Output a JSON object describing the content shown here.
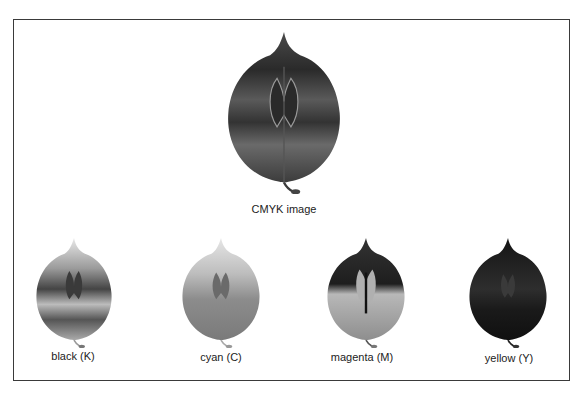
{
  "figure": {
    "main": {
      "caption": "CMYK image",
      "tone": "composite"
    },
    "channels": [
      {
        "id": "black",
        "caption": "black (K)"
      },
      {
        "id": "cyan",
        "caption": "cyan (C)"
      },
      {
        "id": "magenta",
        "caption": "magenta (M)"
      },
      {
        "id": "yellow",
        "caption": "yellow (Y)"
      }
    ]
  },
  "colors": {
    "frame_border": "#3a3a3a",
    "background": "#ffffff",
    "caption_text": "#222222"
  }
}
